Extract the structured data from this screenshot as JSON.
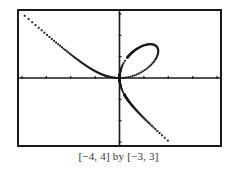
{
  "chart_data": {
    "type": "line",
    "title": "",
    "caption": "[−4, 4] by [−3, 3]",
    "xlabel": "",
    "ylabel": "",
    "xlim": [
      -4,
      4
    ],
    "ylim": [
      -3,
      3
    ],
    "xscale_ticks": 1,
    "yscale_ticks": 1,
    "grid": false,
    "legend": null,
    "curve": "folium of Descartes x^3 + y^3 = 3xy (parametric x=3t/(1+t^3), y=3t^2/(1+t^3))",
    "series": [
      {
        "name": "left branch",
        "points": [
          [
            -3.8,
            2.8
          ],
          [
            -3.0,
            2.05
          ],
          [
            -2.0,
            1.15
          ],
          [
            -1.0,
            0.45
          ],
          [
            -0.5,
            0.15
          ],
          [
            0.0,
            0.0
          ]
        ]
      },
      {
        "name": "loop",
        "points": [
          [
            0.0,
            0.0
          ],
          [
            0.1,
            0.5
          ],
          [
            0.5,
            1.1
          ],
          [
            1.0,
            1.45
          ],
          [
            1.5,
            1.5
          ],
          [
            1.45,
            1.0
          ],
          [
            1.1,
            0.5
          ],
          [
            0.5,
            0.1
          ],
          [
            0.0,
            0.0
          ]
        ]
      },
      {
        "name": "lower branch",
        "points": [
          [
            0.0,
            0.0
          ],
          [
            0.1,
            -0.4
          ],
          [
            0.5,
            -1.2
          ],
          [
            1.0,
            -1.8
          ],
          [
            1.5,
            -2.4
          ],
          [
            2.05,
            -2.95
          ]
        ]
      }
    ]
  },
  "window": {
    "xmin": -4,
    "xmax": 4,
    "ymin": -3,
    "ymax": 3,
    "caption": "[−4, 4] by [−3, 3]"
  },
  "colors": {
    "ink": "#1a1a1a",
    "background": "#ffffff"
  }
}
